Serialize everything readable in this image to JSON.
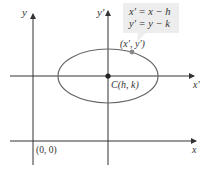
{
  "diagram": {
    "axes": {
      "x_label": "x",
      "y_label": "y",
      "x_prime_label": "x′",
      "y_prime_label": "y′",
      "origin_label": "(0, 0)"
    },
    "ellipse": {
      "center_label": "C(h, k)",
      "point_label": "(x′, y′)"
    },
    "callout": {
      "line1": "x′ = x − h",
      "line2": "y′ = y − k"
    },
    "colors": {
      "axis": "#333333",
      "ellipse": "#666666",
      "center_point": "#222222",
      "point": "#888888",
      "callout_bg": "#ededed"
    }
  }
}
